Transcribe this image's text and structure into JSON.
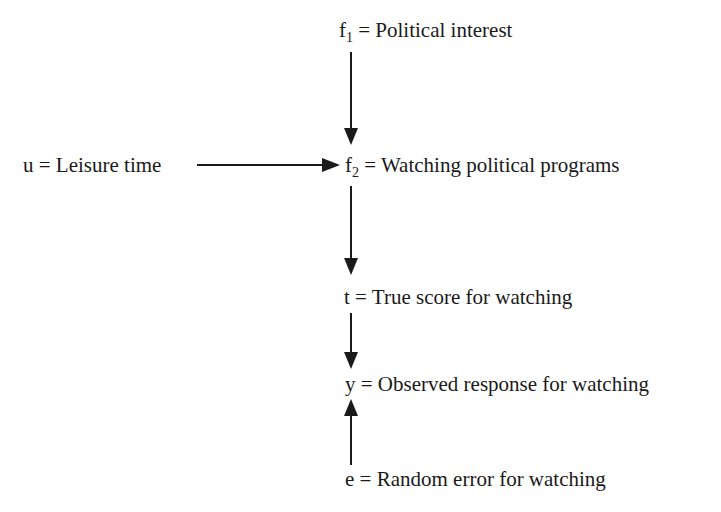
{
  "diagram": {
    "nodes": [
      {
        "id": "f1",
        "var": "f",
        "sub": "1",
        "text": " = Political interest"
      },
      {
        "id": "u",
        "var": "u",
        "sub": "",
        "text": " = Leisure time"
      },
      {
        "id": "f2",
        "var": "f",
        "sub": "2",
        "text": " = Watching political programs"
      },
      {
        "id": "t",
        "var": "t",
        "sub": "",
        "text": " = True score for watching"
      },
      {
        "id": "y",
        "var": "y",
        "sub": "",
        "text": " = Observed response for watching"
      },
      {
        "id": "e",
        "var": "e",
        "sub": "",
        "text": " = Random error for watching"
      }
    ],
    "edges": [
      {
        "from": "f1",
        "to": "f2"
      },
      {
        "from": "u",
        "to": "f2"
      },
      {
        "from": "f2",
        "to": "t"
      },
      {
        "from": "t",
        "to": "y"
      },
      {
        "from": "e",
        "to": "y"
      }
    ],
    "colors": {
      "line": "#1a1a1a",
      "background": "#ffffff"
    }
  }
}
